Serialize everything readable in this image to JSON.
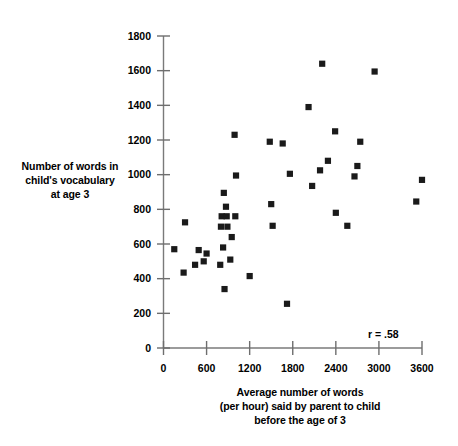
{
  "chart_data": {
    "type": "scatter",
    "title": "",
    "xlabel": "Average number of words (per hour) said by parent to child before the age of 3",
    "ylabel": "Number of words in child's vocabulary at age 3",
    "xlim": [
      0,
      3600
    ],
    "ylim": [
      0,
      1800
    ],
    "xticks": [
      0,
      600,
      1200,
      1800,
      2400,
      3000,
      3600
    ],
    "yticks": [
      0,
      200,
      400,
      600,
      800,
      1000,
      1200,
      1400,
      1600,
      1800
    ],
    "xtick_labels": [
      "0",
      "600",
      "1200",
      "1800",
      "2400",
      "3000",
      "3600"
    ],
    "ytick_labels": [
      "0",
      "200",
      "400",
      "600",
      "800",
      "1000",
      "1200",
      "1400",
      "1600",
      "1800"
    ],
    "grid": false,
    "legend": null,
    "marker": "square",
    "marker_color": "#1a1a1a",
    "annotation": "r = .58",
    "correlation": 0.58,
    "points": [
      [
        150,
        570
      ],
      [
        280,
        435
      ],
      [
        300,
        725
      ],
      [
        440,
        480
      ],
      [
        490,
        565
      ],
      [
        560,
        500
      ],
      [
        600,
        545
      ],
      [
        790,
        480
      ],
      [
        800,
        700
      ],
      [
        810,
        760
      ],
      [
        830,
        580
      ],
      [
        840,
        895
      ],
      [
        850,
        340
      ],
      [
        870,
        815
      ],
      [
        880,
        760
      ],
      [
        890,
        700
      ],
      [
        930,
        510
      ],
      [
        950,
        640
      ],
      [
        990,
        1230
      ],
      [
        1000,
        760
      ],
      [
        1010,
        995
      ],
      [
        1200,
        415
      ],
      [
        1480,
        1190
      ],
      [
        1500,
        830
      ],
      [
        1520,
        705
      ],
      [
        1660,
        1180
      ],
      [
        1720,
        255
      ],
      [
        1760,
        1005
      ],
      [
        2020,
        1390
      ],
      [
        2070,
        935
      ],
      [
        2180,
        1025
      ],
      [
        2210,
        1640
      ],
      [
        2290,
        1080
      ],
      [
        2390,
        1250
      ],
      [
        2400,
        780
      ],
      [
        2560,
        705
      ],
      [
        2660,
        990
      ],
      [
        2700,
        1050
      ],
      [
        2740,
        1190
      ],
      [
        2940,
        1595
      ],
      [
        3520,
        845
      ],
      [
        3600,
        970
      ]
    ]
  },
  "axis_labels": {
    "y_lines": [
      "Number of words in",
      "child's vocabulary",
      "at age 3"
    ],
    "x_lines": [
      "Average number of words",
      "(per hour) said by parent to child",
      "before the age of 3"
    ]
  }
}
